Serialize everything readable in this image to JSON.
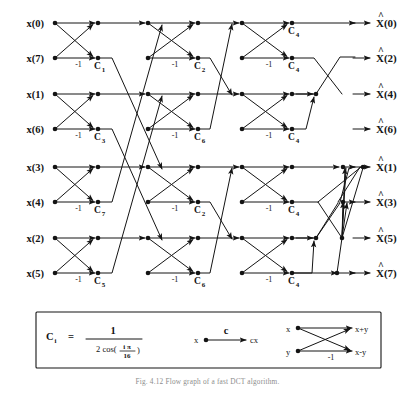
{
  "figure": {
    "type": "signal-flow-graph",
    "caption": "Fig. 4.12   Flow graph of a fast DCT algorithm.",
    "stage_count": 4,
    "inputs": [
      "x(0)",
      "x(7)",
      "x(1)",
      "x(6)",
      "x(3)",
      "x(4)",
      "x(2)",
      "x(5)"
    ],
    "outputs": [
      "X(0)",
      "X(2)",
      "X(4)",
      "X(6)",
      "X(1)",
      "X(3)",
      "X(5)",
      "X(7)"
    ],
    "output_hat": "^",
    "minus_one_label": "-1",
    "coefficient_labels": [
      {
        "base": "C",
        "sub": "1",
        "row": 1,
        "stage": 1
      },
      {
        "base": "C",
        "sub": "3",
        "row": 3,
        "stage": 1
      },
      {
        "base": "C",
        "sub": "7",
        "row": 5,
        "stage": 1
      },
      {
        "base": "C",
        "sub": "5",
        "row": 7,
        "stage": 1
      },
      {
        "base": "C",
        "sub": "2",
        "row": 1,
        "stage": 2
      },
      {
        "base": "C",
        "sub": "6",
        "row": 3,
        "stage": 2
      },
      {
        "base": "C",
        "sub": "2",
        "row": 5,
        "stage": 2
      },
      {
        "base": "C",
        "sub": "6",
        "row": 7,
        "stage": 2
      },
      {
        "base": "C",
        "sub": "4",
        "row": 0,
        "stage": 3
      },
      {
        "base": "C",
        "sub": "4",
        "row": 1,
        "stage": 3
      },
      {
        "base": "C",
        "sub": "4",
        "row": 3,
        "stage": 3
      },
      {
        "base": "C",
        "sub": "4",
        "row": 5,
        "stage": 3
      },
      {
        "base": "C",
        "sub": "4",
        "row": 7,
        "stage": 3
      }
    ]
  },
  "legend": {
    "formula": {
      "lhs_base": "C",
      "lhs_sub": "i",
      "equals": "=",
      "numerator": "1",
      "denominator_prefix": "2 cos(",
      "denominator_num": "i π",
      "denominator_den": "16",
      "denominator_suffix": ")"
    },
    "gain": {
      "input": "x",
      "coefficient": "c",
      "output": "cx"
    },
    "butterfly": {
      "in_top": "x",
      "in_bottom": "y",
      "out_top": "x+y",
      "out_bottom": "x-y",
      "weight": "-1"
    }
  },
  "colors": {
    "ink": "#141414",
    "paper": "#ffffff",
    "caption": "#8d8d8d"
  }
}
